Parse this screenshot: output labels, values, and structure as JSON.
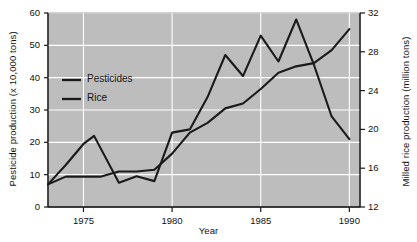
{
  "chart_data": {
    "type": "line",
    "title": "",
    "xlabel": "Year",
    "ylabel": "Pesticide production (x 10,000 tons)",
    "ylabel_right": "Milled rice production (million tons)",
    "xlim": [
      1973,
      1990.6
    ],
    "ylim": [
      0,
      60
    ],
    "ylim_right": [
      12,
      32
    ],
    "xticks": [
      1975,
      1980,
      1985,
      1990
    ],
    "xtick_labels": [
      "1975",
      "1980",
      "1985",
      "1990"
    ],
    "yticks": [
      0,
      10,
      20,
      30,
      40,
      50,
      60
    ],
    "ytick_labels": [
      "0",
      "10",
      "20",
      "30",
      "40",
      "50",
      "60"
    ],
    "yticks_right": [
      12,
      16,
      20,
      24,
      28,
      32
    ],
    "ytick_labels_right": [
      "12",
      "16",
      "20",
      "24",
      "28",
      "32"
    ],
    "grid": "horizontal-and-vertical-white",
    "plot_background": "#bdbdbd",
    "line_color": "#1a1a1a",
    "legend_position": "upper-left-inside",
    "series": [
      {
        "name": "Pesticides",
        "axis": "left",
        "units": "x 10,000 tons",
        "x": [
          1973,
          1974,
          1975,
          1975.6,
          1977,
          1978,
          1979,
          1980,
          1981,
          1982,
          1983,
          1984,
          1985,
          1986,
          1987,
          1988,
          1989,
          1990
        ],
        "values": [
          7,
          13,
          19.5,
          22,
          7.5,
          9.5,
          8,
          23,
          24,
          34,
          47,
          40.5,
          53,
          45,
          58,
          44,
          28,
          21
        ]
      },
      {
        "name": "Rice",
        "axis": "right",
        "units": "million tons",
        "x": [
          1973,
          1974,
          1975,
          1976,
          1977,
          1978,
          1979,
          1980,
          1981,
          1982,
          1983,
          1984,
          1985,
          1986,
          1987,
          1988,
          1989,
          1990
        ],
        "values_left_scale": [
          7,
          9.4,
          9.4,
          9.4,
          11,
          11,
          11.5,
          16.5,
          23,
          26,
          30.5,
          32,
          36.5,
          41.5,
          43.5,
          44.5,
          48.5,
          55
        ],
        "values": [
          14.3,
          15.1,
          15.1,
          15.1,
          15.7,
          15.7,
          15.8,
          17.5,
          19.7,
          20.7,
          22.2,
          22.7,
          24.2,
          25.8,
          26.5,
          26.8,
          28.2,
          30.3
        ]
      }
    ],
    "legend_entries": [
      "Pesticides",
      "Rice"
    ]
  },
  "legend": {
    "pesticides_label": "Pesticides",
    "rice_label": "Rice"
  },
  "axes": {
    "left_title": "Pesticide production (x 10,000 tons)",
    "right_title": "Milled rice production (million tons)",
    "x_title": "Year"
  }
}
